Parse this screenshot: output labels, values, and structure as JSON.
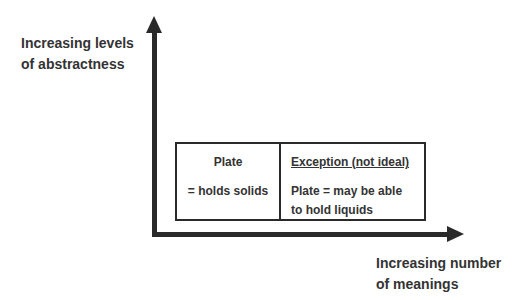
{
  "diagram": {
    "y_axis": {
      "label_line1": "Increasing levels",
      "label_line2": "of abstractness"
    },
    "x_axis": {
      "label_line1": "Increasing number",
      "label_line2": "of meanings"
    },
    "table": {
      "left": {
        "heading": "Plate",
        "body_line1": "= holds solids"
      },
      "right": {
        "heading": "Exception (not ideal)",
        "body_line1": "Plate = may be able",
        "body_line2": "to hold liquids"
      }
    },
    "colors": {
      "axis": "#2a2a2a",
      "text": "#333333",
      "background": "#ffffff"
    }
  }
}
